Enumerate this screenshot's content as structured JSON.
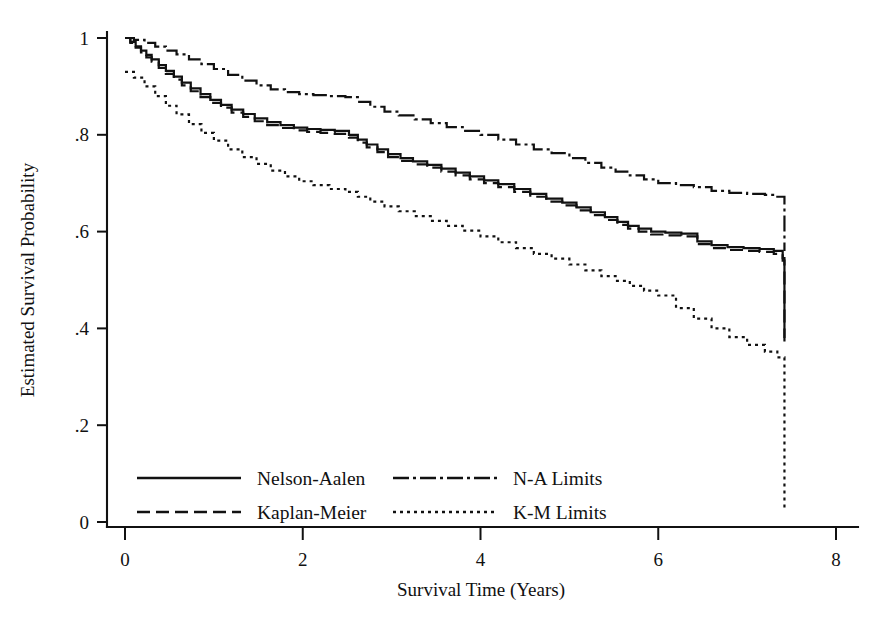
{
  "chart_data": {
    "type": "line",
    "title": "",
    "xlabel": "Survival Time (Years)",
    "ylabel": "Estimated Survival Probability",
    "xlim": [
      0,
      8
    ],
    "ylim": [
      0,
      1
    ],
    "xticks": [
      0,
      2,
      4,
      6,
      8
    ],
    "xtick_labels": [
      "0",
      "2",
      "4",
      "6",
      "8"
    ],
    "yticks": [
      0,
      0.2,
      0.4,
      0.6,
      0.8,
      1
    ],
    "ytick_labels": [
      "0",
      ".2",
      ".4",
      ".6",
      ".8",
      "1"
    ],
    "grid": false,
    "legend_position": "lower-left-inside",
    "step_type": "post",
    "series": [
      {
        "name": "Nelson-Aalen",
        "style": "solid",
        "x": [
          0.0,
          0.06,
          0.12,
          0.18,
          0.24,
          0.3,
          0.38,
          0.46,
          0.55,
          0.64,
          0.74,
          0.85,
          0.96,
          1.08,
          1.2,
          1.33,
          1.46,
          1.6,
          1.75,
          1.9,
          2.05,
          2.2,
          2.36,
          2.52,
          2.62,
          2.72,
          2.84,
          2.96,
          3.1,
          3.24,
          3.4,
          3.56,
          3.72,
          3.88,
          4.04,
          4.2,
          4.38,
          4.56,
          4.74,
          4.92,
          5.08,
          5.24,
          5.4,
          5.54,
          5.66,
          5.78,
          5.92,
          6.08,
          6.26,
          6.44,
          6.6,
          6.78,
          6.96,
          7.14,
          7.3,
          7.4,
          7.42
        ],
        "y": [
          1.0,
          0.992,
          0.983,
          0.974,
          0.965,
          0.956,
          0.944,
          0.932,
          0.92,
          0.908,
          0.896,
          0.884,
          0.872,
          0.862,
          0.852,
          0.843,
          0.834,
          0.826,
          0.82,
          0.815,
          0.812,
          0.81,
          0.808,
          0.8,
          0.79,
          0.78,
          0.77,
          0.76,
          0.752,
          0.745,
          0.738,
          0.73,
          0.722,
          0.714,
          0.706,
          0.698,
          0.688,
          0.678,
          0.668,
          0.66,
          0.65,
          0.64,
          0.63,
          0.62,
          0.612,
          0.606,
          0.6,
          0.598,
          0.596,
          0.58,
          0.572,
          0.568,
          0.566,
          0.564,
          0.56,
          0.545,
          0.49
        ]
      },
      {
        "name": "Kaplan-Meier",
        "style": "dashed",
        "x": [
          0.0,
          0.06,
          0.12,
          0.18,
          0.24,
          0.3,
          0.38,
          0.46,
          0.55,
          0.64,
          0.74,
          0.85,
          0.96,
          1.08,
          1.2,
          1.33,
          1.46,
          1.6,
          1.75,
          1.9,
          2.05,
          2.2,
          2.36,
          2.52,
          2.62,
          2.72,
          2.84,
          2.96,
          3.1,
          3.24,
          3.4,
          3.56,
          3.72,
          3.88,
          4.04,
          4.2,
          4.38,
          4.56,
          4.74,
          4.92,
          5.08,
          5.24,
          5.4,
          5.54,
          5.66,
          5.78,
          5.92,
          6.08,
          6.26,
          6.44,
          6.6,
          6.78,
          6.96,
          7.14,
          7.3,
          7.4,
          7.42
        ],
        "y": [
          1.0,
          0.99,
          0.98,
          0.97,
          0.96,
          0.951,
          0.938,
          0.926,
          0.914,
          0.902,
          0.89,
          0.878,
          0.866,
          0.856,
          0.846,
          0.837,
          0.828,
          0.82,
          0.814,
          0.809,
          0.806,
          0.804,
          0.802,
          0.794,
          0.784,
          0.774,
          0.764,
          0.754,
          0.746,
          0.739,
          0.732,
          0.724,
          0.716,
          0.708,
          0.7,
          0.692,
          0.682,
          0.672,
          0.662,
          0.654,
          0.644,
          0.634,
          0.624,
          0.614,
          0.606,
          0.6,
          0.594,
          0.592,
          0.59,
          0.574,
          0.566,
          0.562,
          0.56,
          0.558,
          0.554,
          0.54,
          0.486
        ]
      },
      {
        "name": "N-A Limits",
        "style": "dashdot",
        "band": "upper",
        "x": [
          0.0,
          0.1,
          0.22,
          0.34,
          0.46,
          0.58,
          0.72,
          0.86,
          1.0,
          1.16,
          1.32,
          1.48,
          1.64,
          1.8,
          1.96,
          2.12,
          2.3,
          2.48,
          2.62,
          2.76,
          2.92,
          3.08,
          3.26,
          3.44,
          3.62,
          3.8,
          4.0,
          4.2,
          4.4,
          4.6,
          4.8,
          5.0,
          5.18,
          5.36,
          5.52,
          5.68,
          5.84,
          6.0,
          6.2,
          6.4,
          6.6,
          6.8,
          7.0,
          7.2,
          7.34,
          7.42
        ],
        "y": [
          1.0,
          0.996,
          0.99,
          0.982,
          0.974,
          0.966,
          0.956,
          0.946,
          0.936,
          0.924,
          0.912,
          0.902,
          0.894,
          0.888,
          0.884,
          0.882,
          0.88,
          0.878,
          0.868,
          0.858,
          0.848,
          0.84,
          0.832,
          0.824,
          0.816,
          0.808,
          0.8,
          0.79,
          0.78,
          0.77,
          0.762,
          0.752,
          0.742,
          0.732,
          0.724,
          0.716,
          0.708,
          0.7,
          0.696,
          0.692,
          0.684,
          0.68,
          0.678,
          0.676,
          0.672,
          0.668
        ]
      },
      {
        "name": "K-M Limits",
        "style": "dotted",
        "band": "lower",
        "x": [
          0.0,
          0.1,
          0.22,
          0.34,
          0.46,
          0.58,
          0.72,
          0.86,
          1.0,
          1.16,
          1.32,
          1.48,
          1.64,
          1.8,
          1.96,
          2.12,
          2.3,
          2.48,
          2.62,
          2.76,
          2.92,
          3.08,
          3.26,
          3.44,
          3.62,
          3.8,
          4.0,
          4.2,
          4.4,
          4.6,
          4.8,
          5.0,
          5.18,
          5.36,
          5.52,
          5.68,
          5.84,
          6.0,
          6.2,
          6.4,
          6.6,
          6.8,
          7.0,
          7.2,
          7.34,
          7.42
        ],
        "y": [
          0.93,
          0.918,
          0.9,
          0.88,
          0.86,
          0.842,
          0.822,
          0.804,
          0.788,
          0.77,
          0.754,
          0.74,
          0.726,
          0.714,
          0.704,
          0.696,
          0.688,
          0.682,
          0.672,
          0.662,
          0.652,
          0.642,
          0.632,
          0.622,
          0.612,
          0.602,
          0.59,
          0.578,
          0.566,
          0.554,
          0.544,
          0.532,
          0.52,
          0.508,
          0.498,
          0.488,
          0.478,
          0.468,
          0.442,
          0.42,
          0.4,
          0.382,
          0.366,
          0.352,
          0.34,
          0.33
        ]
      }
    ],
    "terminal_drops": [
      {
        "series": "Nelson-Aalen",
        "x": 7.42,
        "from": 0.49,
        "to": 0.38
      },
      {
        "series": "Kaplan-Meier",
        "x": 7.42,
        "from": 0.486,
        "to": 0.372
      },
      {
        "series": "N-A Limits",
        "x": 7.42,
        "from": 0.668,
        "to": 0.56
      },
      {
        "series": "K-M Limits",
        "x": 7.42,
        "from": 0.33,
        "to": 0.03
      }
    ]
  },
  "legend": {
    "entries": [
      {
        "label": "Nelson-Aalen",
        "style": "solid"
      },
      {
        "label": "Kaplan-Meier",
        "style": "dashed"
      },
      {
        "label": "N-A Limits",
        "style": "dashdot"
      },
      {
        "label": "K-M Limits",
        "style": "dotted"
      }
    ]
  }
}
